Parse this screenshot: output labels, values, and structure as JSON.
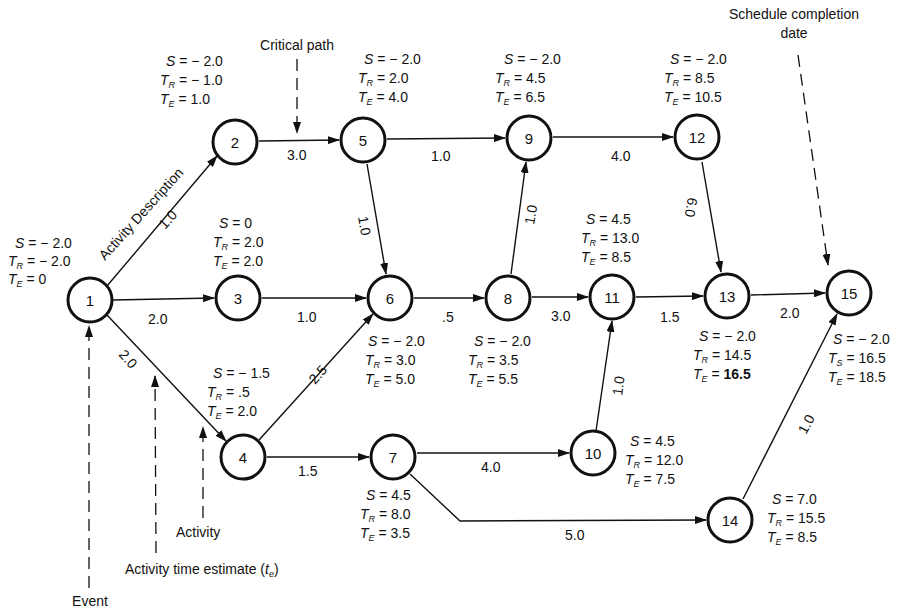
{
  "diagram": {
    "type": "PERT network",
    "nodes": [
      {
        "id": "1",
        "S": "− 2.0",
        "TR": "− 2.0",
        "TE": "0"
      },
      {
        "id": "2",
        "S": "− 2.0",
        "TR": "− 1.0",
        "TE": "1.0"
      },
      {
        "id": "3",
        "S": "0",
        "TR": "2.0",
        "TE": "2.0"
      },
      {
        "id": "4",
        "S": "− 1.5",
        "TR": ".5",
        "TE": "2.0"
      },
      {
        "id": "5",
        "S": "− 2.0",
        "TR": "2.0",
        "TE": "4.0"
      },
      {
        "id": "6",
        "S": "− 2.0",
        "TR": "3.0",
        "TE": "5.0"
      },
      {
        "id": "7",
        "S": "4.5",
        "TR": "8.0",
        "TE": "3.5"
      },
      {
        "id": "8",
        "S": "− 2.0",
        "TR": "3.5",
        "TE": "5.5"
      },
      {
        "id": "9",
        "S": "− 2.0",
        "TR": "4.5",
        "TE": "6.5"
      },
      {
        "id": "10",
        "S": "4.5",
        "TR": "12.0",
        "TE": "7.5"
      },
      {
        "id": "11",
        "S": "4.5",
        "TR": "13.0",
        "TE": "8.5"
      },
      {
        "id": "12",
        "S": "− 2.0",
        "TR": "8.5",
        "TE": "10.5"
      },
      {
        "id": "13",
        "S": "− 2.0",
        "TR": "14.5",
        "TE": "16.5"
      },
      {
        "id": "14",
        "S": "7.0",
        "TR": "15.5",
        "TE": "8.5"
      },
      {
        "id": "15",
        "S": "− 2.0",
        "TS": "16.5",
        "TE": "18.5"
      }
    ],
    "edges": [
      {
        "from": "1",
        "to": "2",
        "time": "1.0"
      },
      {
        "from": "1",
        "to": "3",
        "time": "2.0"
      },
      {
        "from": "1",
        "to": "4",
        "time": "2.0"
      },
      {
        "from": "2",
        "to": "5",
        "time": "3.0"
      },
      {
        "from": "3",
        "to": "6",
        "time": "1.0"
      },
      {
        "from": "4",
        "to": "6",
        "time": "2.5"
      },
      {
        "from": "4",
        "to": "7",
        "time": "1.5"
      },
      {
        "from": "5",
        "to": "9",
        "time": "1.0"
      },
      {
        "from": "5",
        "to": "6",
        "time": "1.0"
      },
      {
        "from": "6",
        "to": "8",
        "time": ".5"
      },
      {
        "from": "8",
        "to": "9",
        "time": "1.0"
      },
      {
        "from": "8",
        "to": "11",
        "time": "3.0"
      },
      {
        "from": "9",
        "to": "12",
        "time": "4.0"
      },
      {
        "from": "12",
        "to": "13",
        "time": "6.0"
      },
      {
        "from": "7",
        "to": "10",
        "time": "4.0"
      },
      {
        "from": "7",
        "to": "14",
        "time": "5.0"
      },
      {
        "from": "10",
        "to": "11",
        "time": "1.0"
      },
      {
        "from": "11",
        "to": "13",
        "time": "1.5"
      },
      {
        "from": "13",
        "to": "15",
        "time": "2.0"
      },
      {
        "from": "14",
        "to": "15",
        "time": "1.0"
      }
    ],
    "callouts": {
      "critical_path": "Critical path",
      "schedule_completion_line1": "Schedule completion",
      "schedule_completion_line2": "date",
      "activity_description": "Activity Description",
      "activity": "Activity",
      "activity_time_estimate": "Activity time estimate (",
      "activity_time_estimate_sym": "t",
      "activity_time_estimate_sub": "e",
      "activity_time_estimate_close": ")",
      "event": "Event"
    },
    "symbols": {
      "S": "S",
      "T": "T",
      "R": "R",
      "E": "E",
      "Ssub": "S",
      "eq": " = "
    }
  }
}
